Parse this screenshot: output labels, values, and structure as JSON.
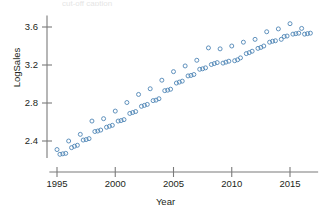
{
  "figure": {
    "caption_sliver": "cut-off caption",
    "axis_color": "#7a7a7a",
    "marker_color": "#4f86b5",
    "text_color": "#231f20",
    "background": "#ffffff"
  },
  "chart_data": {
    "type": "scatter",
    "title": "",
    "xlabel": "Year",
    "ylabel": "LogSales",
    "xlim": [
      1994.6,
      2016.9
    ],
    "ylim": [
      2.22,
      3.72
    ],
    "xticks": [
      1995,
      2000,
      2005,
      2010,
      2015
    ],
    "xticklabels": [
      "1995",
      "2000",
      "2005",
      "2010",
      "2015"
    ],
    "yticks": [
      2.4,
      2.8,
      3.2,
      3.6
    ],
    "yticklabels": [
      "2.4",
      "2.8",
      "3.2",
      "3.6"
    ],
    "grid": false,
    "legend": null,
    "marker": "open-circle",
    "marker_size": 4,
    "series": [
      {
        "name": "LogSales",
        "points": [
          [
            1995.0,
            2.31
          ],
          [
            1995.25,
            2.26
          ],
          [
            1995.5,
            2.265
          ],
          [
            1995.75,
            2.27
          ],
          [
            1996.0,
            2.4
          ],
          [
            1996.25,
            2.33
          ],
          [
            1996.5,
            2.345
          ],
          [
            1996.75,
            2.355
          ],
          [
            1997.0,
            2.47
          ],
          [
            1997.25,
            2.41
          ],
          [
            1997.5,
            2.415
          ],
          [
            1997.75,
            2.425
          ],
          [
            1998.0,
            2.61
          ],
          [
            1998.25,
            2.5
          ],
          [
            1998.5,
            2.505
          ],
          [
            1998.75,
            2.515
          ],
          [
            1999.0,
            2.635
          ],
          [
            1999.25,
            2.545
          ],
          [
            1999.5,
            2.555
          ],
          [
            1999.75,
            2.565
          ],
          [
            2000.0,
            2.715
          ],
          [
            2000.25,
            2.61
          ],
          [
            2000.5,
            2.615
          ],
          [
            2000.75,
            2.625
          ],
          [
            2001.0,
            2.805
          ],
          [
            2001.25,
            2.69
          ],
          [
            2001.5,
            2.7
          ],
          [
            2001.75,
            2.71
          ],
          [
            2002.0,
            2.89
          ],
          [
            2002.25,
            2.765
          ],
          [
            2002.5,
            2.775
          ],
          [
            2002.75,
            2.785
          ],
          [
            2003.0,
            2.95
          ],
          [
            2003.25,
            2.825
          ],
          [
            2003.5,
            2.83
          ],
          [
            2003.75,
            2.845
          ],
          [
            2004.0,
            3.04
          ],
          [
            2004.25,
            2.93
          ],
          [
            2004.5,
            2.935
          ],
          [
            2004.75,
            2.945
          ],
          [
            2005.0,
            3.13
          ],
          [
            2005.25,
            3.01
          ],
          [
            2005.5,
            3.02
          ],
          [
            2005.75,
            3.03
          ],
          [
            2006.0,
            3.19
          ],
          [
            2006.25,
            3.085
          ],
          [
            2006.5,
            3.09
          ],
          [
            2006.75,
            3.1
          ],
          [
            2007.0,
            3.25
          ],
          [
            2007.25,
            3.155
          ],
          [
            2007.5,
            3.16
          ],
          [
            2007.75,
            3.17
          ],
          [
            2008.0,
            3.38
          ],
          [
            2008.25,
            3.205
          ],
          [
            2008.5,
            3.215
          ],
          [
            2008.75,
            3.225
          ],
          [
            2009.0,
            3.37
          ],
          [
            2009.25,
            3.22
          ],
          [
            2009.5,
            3.23
          ],
          [
            2009.75,
            3.24
          ],
          [
            2010.0,
            3.4
          ],
          [
            2010.25,
            3.245
          ],
          [
            2010.5,
            3.255
          ],
          [
            2010.75,
            3.275
          ],
          [
            2011.0,
            3.44
          ],
          [
            2011.25,
            3.32
          ],
          [
            2011.5,
            3.33
          ],
          [
            2011.75,
            3.345
          ],
          [
            2012.0,
            3.47
          ],
          [
            2012.25,
            3.375
          ],
          [
            2012.5,
            3.385
          ],
          [
            2012.75,
            3.4
          ],
          [
            2013.0,
            3.55
          ],
          [
            2013.25,
            3.44
          ],
          [
            2013.5,
            3.45
          ],
          [
            2013.75,
            3.455
          ],
          [
            2014.0,
            3.58
          ],
          [
            2014.25,
            3.47
          ],
          [
            2014.5,
            3.5
          ],
          [
            2014.75,
            3.505
          ],
          [
            2015.0,
            3.635
          ],
          [
            2015.25,
            3.525
          ],
          [
            2015.5,
            3.53
          ],
          [
            2015.75,
            3.535
          ],
          [
            2016.0,
            3.585
          ],
          [
            2016.25,
            3.525
          ],
          [
            2016.5,
            3.53
          ],
          [
            2016.75,
            3.535
          ]
        ]
      }
    ]
  }
}
